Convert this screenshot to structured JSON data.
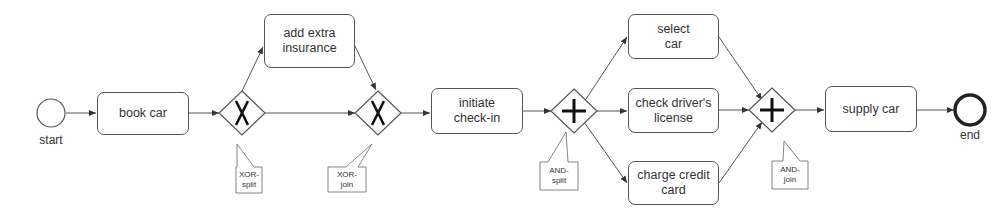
{
  "diagram": {
    "type": "BPMN process",
    "colors": {
      "stroke": "#555555",
      "text": "#333333",
      "background": "#ffffff"
    },
    "events": {
      "start": {
        "label": "start"
      },
      "end": {
        "label": "end"
      }
    },
    "tasks": {
      "book_car": "book car",
      "add_extra_insurance": "add extra\ninsurance",
      "initiate_check_in": "initiate\ncheck-in",
      "select_car": "select\ncar",
      "check_drivers_license": "check driver's\nlicense",
      "charge_credit_card": "charge credit\ncard",
      "supply_car": "supply car"
    },
    "gateways": {
      "xor_split": {
        "symbol": "X",
        "annotation": "XOR-\nsplit"
      },
      "xor_join": {
        "symbol": "X",
        "annotation": "XOR-\njoin"
      },
      "and_split": {
        "symbol": "+",
        "annotation": "AND-\nsplit"
      },
      "and_join": {
        "symbol": "+",
        "annotation": "AND-\njoin"
      }
    },
    "flows": [
      [
        "start",
        "book car"
      ],
      [
        "book car",
        "XOR-split"
      ],
      [
        "XOR-split",
        "add extra insurance"
      ],
      [
        "XOR-split",
        "XOR-join"
      ],
      [
        "add extra insurance",
        "XOR-join"
      ],
      [
        "XOR-join",
        "initiate check-in"
      ],
      [
        "initiate check-in",
        "AND-split"
      ],
      [
        "AND-split",
        "select car"
      ],
      [
        "AND-split",
        "check driver's license"
      ],
      [
        "AND-split",
        "charge credit card"
      ],
      [
        "select car",
        "AND-join"
      ],
      [
        "check driver's license",
        "AND-join"
      ],
      [
        "charge credit card",
        "AND-join"
      ],
      [
        "AND-join",
        "supply car"
      ],
      [
        "supply car",
        "end"
      ]
    ]
  }
}
